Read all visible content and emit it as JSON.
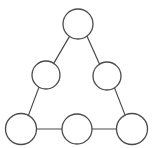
{
  "figure": {
    "title": "",
    "type": "graph-diagram",
    "background_color": "#ffffff",
    "width": 155,
    "height": 148
  },
  "style": {
    "node_fill": "#ffffff",
    "node_stroke": "#4a4a4a",
    "node_stroke_width": 1.3,
    "edge_stroke": "#4a4a4a",
    "edge_stroke_width": 1.2
  },
  "graph": {
    "node_count": 6,
    "edge_count": 6,
    "directed": false,
    "nodes": [
      {
        "id": "n1",
        "label": "",
        "cx": 78,
        "cy": 24,
        "r": 15.0,
        "row": "top"
      },
      {
        "id": "n2",
        "label": "",
        "cx": 46,
        "cy": 75,
        "r": 14.0,
        "row": "middle-left"
      },
      {
        "id": "n3",
        "label": "",
        "cx": 107,
        "cy": 76,
        "r": 14.0,
        "row": "middle-right"
      },
      {
        "id": "n4",
        "label": "",
        "cx": 21,
        "cy": 129,
        "r": 15.5,
        "row": "bottom-left"
      },
      {
        "id": "n5",
        "label": "",
        "cx": 77,
        "cy": 129,
        "r": 15.0,
        "row": "bottom-middle"
      },
      {
        "id": "n6",
        "label": "",
        "cx": 132,
        "cy": 129,
        "r": 15.5,
        "row": "bottom-right"
      }
    ],
    "edges": [
      {
        "id": "e1",
        "source": "n1",
        "target": "n2",
        "x1": 69.5,
        "y1": 36.4,
        "x2": 53.9,
        "y2": 63.1
      },
      {
        "id": "e2",
        "source": "n1",
        "target": "n3",
        "x1": 86.9,
        "y1": 36.1,
        "x2": 99.6,
        "y2": 64.3
      },
      {
        "id": "e3",
        "source": "n2",
        "target": "n4",
        "x1": 39.0,
        "y1": 87.1,
        "x2": 28.4,
        "y2": 115.4
      },
      {
        "id": "e4",
        "source": "n3",
        "target": "n6",
        "x1": 114.5,
        "y1": 87.9,
        "x2": 125.0,
        "y2": 114.9
      },
      {
        "id": "e5",
        "source": "n4",
        "target": "n5",
        "x1": 36.5,
        "y1": 129,
        "x2": 62.0,
        "y2": 129
      },
      {
        "id": "e6",
        "source": "n5",
        "target": "n6",
        "x1": 92.0,
        "y1": 129,
        "x2": 116.5,
        "y2": 129
      }
    ]
  }
}
